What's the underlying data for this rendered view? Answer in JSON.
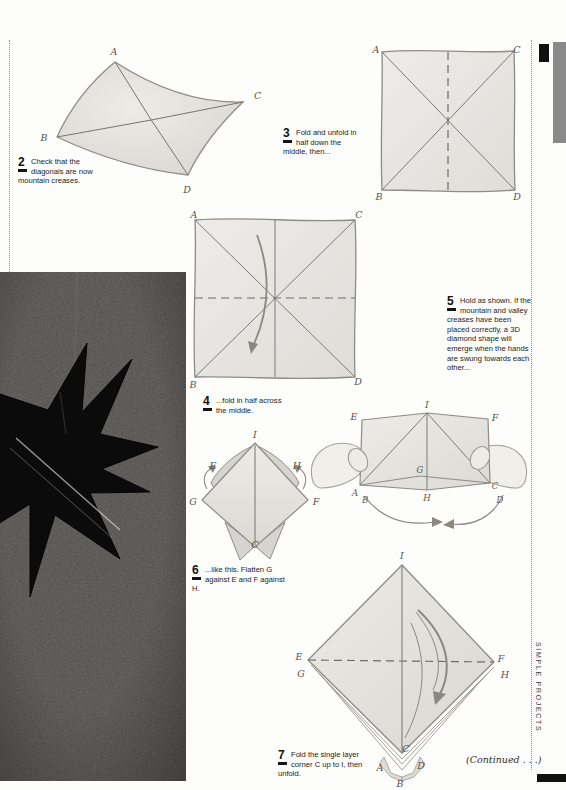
{
  "page": {
    "side_tab": "SIMPLE PROJECTS",
    "continued": "(Continued . . .)"
  },
  "colors": {
    "tab_gray": "#8a8a8a",
    "tab_black": "#111111",
    "paper_fill": "#e9e7e2",
    "ink": "#1c1c1a"
  },
  "steps": [
    {
      "num": "2",
      "text": "Check that the diagonals are now mountain creases."
    },
    {
      "num": "3",
      "text": "Fold and unfold in half down the middle, then..."
    },
    {
      "num": "4",
      "text": "...fold in half across the middle."
    },
    {
      "num": "5",
      "text": "Hold as shown. If the mountain and valley creases have been placed correctly, a 3D diamond shape will emerge when the hands are swung towards each other..."
    },
    {
      "num": "6",
      "text": "...like this. Flatten G against E and F against H."
    },
    {
      "num": "7",
      "text": "Fold the single layer corner C up to I, then unfold."
    }
  ],
  "diagrams": {
    "step2": {
      "labels": {
        "A": "A",
        "B": "B",
        "C": "C",
        "D": "D"
      }
    },
    "step3": {
      "labels": {
        "A": "A",
        "B": "B",
        "C": "C",
        "D": "D"
      }
    },
    "step4": {
      "labels": {
        "A": "A",
        "B": "B",
        "C": "C",
        "D": "D"
      }
    },
    "step5": {
      "labels": {
        "I": "I",
        "E": "E",
        "F": "F",
        "G": "G",
        "H": "H",
        "A": "A",
        "B": "B",
        "C": "C",
        "D": "D"
      }
    },
    "step6": {
      "labels": {
        "I": "I",
        "E": "E",
        "H": "H",
        "G": "G",
        "F": "F",
        "C": "C"
      }
    },
    "step7": {
      "labels": {
        "I": "I",
        "E": "E",
        "G": "G",
        "F": "F",
        "H": "H",
        "C": "C",
        "A": "A",
        "D": "D",
        "B": "B"
      }
    }
  }
}
